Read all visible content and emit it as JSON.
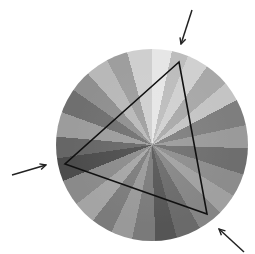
{
  "figure": {
    "background": "#ffffff",
    "disc": {
      "cx": 152,
      "cy": 145,
      "r": 96,
      "center_x": 152,
      "center_y": 145,
      "wedges": [
        {
          "from": 0,
          "to": 12,
          "color": "#e6e6e6"
        },
        {
          "from": 12,
          "to": 22,
          "color": "#bdbdbd"
        },
        {
          "from": 22,
          "to": 35,
          "color": "#d0d0d0"
        },
        {
          "from": 35,
          "to": 50,
          "color": "#a8a8a8"
        },
        {
          "from": 50,
          "to": 62,
          "color": "#c4c4c4"
        },
        {
          "from": 62,
          "to": 78,
          "color": "#7e7e7e"
        },
        {
          "from": 78,
          "to": 92,
          "color": "#9a9a9a"
        },
        {
          "from": 92,
          "to": 108,
          "color": "#6e6e6e"
        },
        {
          "from": 108,
          "to": 122,
          "color": "#8c8c8c"
        },
        {
          "from": 122,
          "to": 135,
          "color": "#a0a0a0"
        },
        {
          "from": 135,
          "to": 150,
          "color": "#858585"
        },
        {
          "from": 150,
          "to": 165,
          "color": "#6a6a6a"
        },
        {
          "from": 165,
          "to": 178,
          "color": "#555555"
        },
        {
          "from": 178,
          "to": 192,
          "color": "#7a7a7a"
        },
        {
          "from": 192,
          "to": 205,
          "color": "#999999"
        },
        {
          "from": 205,
          "to": 218,
          "color": "#7b7b7b"
        },
        {
          "from": 218,
          "to": 232,
          "color": "#a4a4a4"
        },
        {
          "from": 232,
          "to": 248,
          "color": "#8a8a8a"
        },
        {
          "from": 248,
          "to": 262,
          "color": "#4c4c4c"
        },
        {
          "from": 262,
          "to": 275,
          "color": "#666666"
        },
        {
          "from": 275,
          "to": 290,
          "color": "#9c9c9c"
        },
        {
          "from": 290,
          "to": 305,
          "color": "#6f6f6f"
        },
        {
          "from": 305,
          "to": 318,
          "color": "#8f8f8f"
        },
        {
          "from": 318,
          "to": 332,
          "color": "#b8b8b8"
        },
        {
          "from": 332,
          "to": 345,
          "color": "#9e9e9e"
        },
        {
          "from": 345,
          "to": 360,
          "color": "#cfcfcf"
        }
      ]
    },
    "triangle": {
      "points": [
        [
          179,
          62
        ],
        [
          65,
          164
        ],
        [
          207,
          214
        ]
      ],
      "stroke": "#111111",
      "stroke_width": 1.6
    },
    "arrows": [
      {
        "name": "arrow-top",
        "from": [
          192,
          10
        ],
        "to": [
          181,
          44
        ]
      },
      {
        "name": "arrow-left",
        "from": [
          12,
          175
        ],
        "to": [
          46,
          165
        ]
      },
      {
        "name": "arrow-bottom-right",
        "from": [
          244,
          252
        ],
        "to": [
          219,
          229
        ]
      }
    ],
    "arrow_color": "#222222"
  }
}
